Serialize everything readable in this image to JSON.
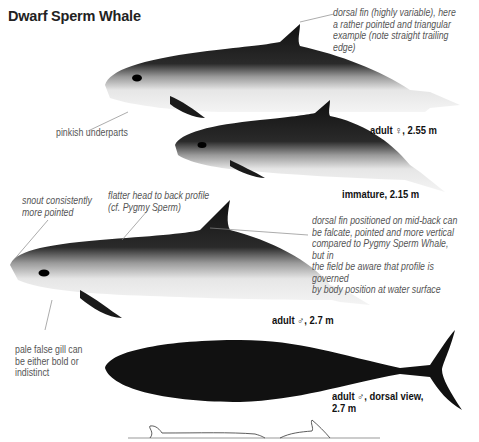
{
  "title": "Dwarf Sperm Whale",
  "annotations": {
    "dorsal_fin_top": [
      "dorsal fin (highly variable), here",
      "a rather pointed and triangular",
      "example (note straight trailing edge)"
    ],
    "pinkish_underparts": "pinkish underparts",
    "snout": [
      "snout consistently",
      "more pointed"
    ],
    "flatter_head": [
      "flatter head to back profile",
      "(cf. Pygmy Sperm)"
    ],
    "dorsal_fin_mid": [
      "dorsal fin positioned on mid-back can",
      "be falcate, pointed and more vertical",
      "compared to Pygmy Sperm Whale, but in",
      "the field be aware that profile is governed",
      "by body position at water surface"
    ],
    "false_gill": [
      "pale false gill can",
      "be either bold or",
      "indistinct"
    ]
  },
  "figures": [
    {
      "label": "adult ♀, 2.55 m"
    },
    {
      "label": "immature, 2.15 m"
    },
    {
      "label": "adult ♂, 2.7 m"
    },
    {
      "label_lines": [
        "adult ♂, dorsal view,",
        "2.7 m"
      ]
    }
  ],
  "colors": {
    "body_dark": "#1a1a1a",
    "belly": "#e8e8e8",
    "line": "#888888"
  }
}
